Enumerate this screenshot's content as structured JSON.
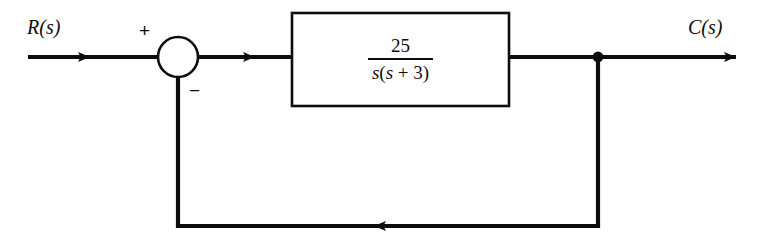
{
  "diagram": {
    "type": "control-system-block-diagram",
    "background_color": "#ffffff",
    "line_color": "#0d0d0d",
    "signals": {
      "input_label": "R(s)",
      "output_label": "C(s)"
    },
    "summing_junction": {
      "name": "summing-junction",
      "shape": "circle",
      "center_x": 178,
      "center_y": 57,
      "radius": 20,
      "plus_sign": "+",
      "minus_sign": "−",
      "plus_input": "R(s)",
      "minus_input": "feedback"
    },
    "plant_block": {
      "name": "transfer-function-block",
      "x": 292,
      "y": 13,
      "width": 217,
      "height": 93,
      "transfer_function": {
        "numerator": "25",
        "denominator_s": "s",
        "denominator_factor": "(s + 3)",
        "denominator": "s(s + 3)",
        "full": "25 / (s(s + 3))"
      }
    },
    "takeoff_point": {
      "name": "takeoff-node",
      "x": 598,
      "y": 57,
      "radius": 5
    },
    "feedback_path": {
      "name": "feedback-path",
      "gain": "1",
      "direction": "right-to-left",
      "bottom_y": 226,
      "left_x": 178,
      "right_x": 598,
      "arrow_x": 374
    },
    "wires": [
      {
        "name": "input-wire",
        "from_x": 28,
        "to_x": 158,
        "y": 57,
        "arrow_x": 90
      },
      {
        "name": "error-wire",
        "from_x": 198,
        "to_x": 292,
        "y": 57,
        "arrow_x": 255
      },
      {
        "name": "output-wire",
        "from_x": 509,
        "to_x": 736,
        "y": 57,
        "arrow_x": 736
      }
    ]
  }
}
